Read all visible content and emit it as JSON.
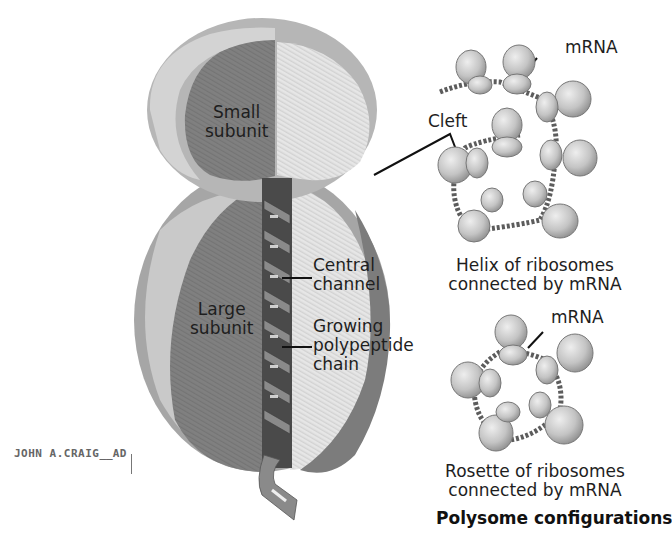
{
  "figure": {
    "title": "Polysome configurations",
    "signature": "JOHN A.CRAIG",
    "signature_suffix": "AD",
    "colors": {
      "dark_face": "#7a7a7a",
      "light_face": "#e4e4e4",
      "mid_rim": "#a9a9a9",
      "ribosome": "#c8c8c8",
      "mrna": "#5c5c5c",
      "leader_line": "#111111"
    }
  },
  "ribosome_diagram": {
    "labels": {
      "small_subunit": [
        "Small",
        "subunit"
      ],
      "large_subunit": [
        "Large",
        "subunit"
      ],
      "central_channel": [
        "Central",
        "channel"
      ],
      "growing_chain": [
        "Growing",
        "polypeptide",
        "chain"
      ]
    }
  },
  "helix_panel": {
    "mrna_label": "mRNA",
    "cleft_label": "Cleft",
    "caption": [
      "Helix of ribosomes",
      "connected by mRNA"
    ]
  },
  "rosette_panel": {
    "mrna_label": "mRNA",
    "caption": [
      "Rosette of ribosomes",
      "connected by mRNA"
    ]
  }
}
